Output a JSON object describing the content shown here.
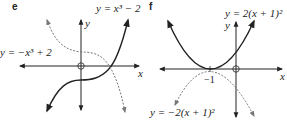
{
  "panels": [
    {
      "id": "e",
      "label": "e",
      "curves": [
        {
          "style": "solid",
          "equation": "y = x^3 - 2",
          "label_text": "y = x³ − 2"
        },
        {
          "style": "dashed",
          "equation": "y = -x^3 + 2",
          "label_text": "y = −x³ + 2"
        }
      ],
      "axis_labels": {
        "x": "x",
        "y": "y"
      }
    },
    {
      "id": "f",
      "label": "f",
      "curves": [
        {
          "style": "solid",
          "equation": "y = 2(x+1)^2",
          "label_text": "y =  2(x + 1)²"
        },
        {
          "style": "dashed",
          "equation": "y = -2(x+1)^2",
          "label_text": "y = −2(x + 1)²"
        }
      ],
      "axis_labels": {
        "x": "x",
        "y": "y"
      },
      "tick_labels": [
        "−1"
      ]
    }
  ]
}
